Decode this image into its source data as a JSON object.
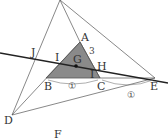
{
  "diagram": {
    "points": {
      "A": {
        "label": "A",
        "x": 80,
        "y": 42
      },
      "B": {
        "label": "B",
        "x": 46,
        "y": 78
      },
      "C": {
        "label": "C",
        "x": 100,
        "y": 78
      },
      "D": {
        "label": "D",
        "x": 12,
        "y": 115
      },
      "E": {
        "label": "E",
        "x": 155,
        "y": 78
      },
      "F": {
        "label": "F",
        "x": 60,
        "y": 0
      },
      "G": {
        "label": "G",
        "x": 76,
        "y": 66
      },
      "H": {
        "label": "H",
        "x": 95,
        "y": 69
      },
      "I": {
        "label": "I",
        "x": 57,
        "y": 62
      },
      "J": {
        "label": "J",
        "x": 36,
        "y": 58
      }
    },
    "labels": {
      "A": "A",
      "B": "B",
      "C": "C",
      "D": "D",
      "E": "E",
      "F": "F",
      "G": "G",
      "H": "H",
      "I": "I",
      "J": "J",
      "I2": "I"
    },
    "annotations": {
      "ah_ratio": "3",
      "bc_ratio": "①",
      "ce_ratio": "①"
    },
    "colors": {
      "shaded_triangle": "#8a8a8a",
      "line": "#555555",
      "thick_line": "#222222"
    }
  }
}
